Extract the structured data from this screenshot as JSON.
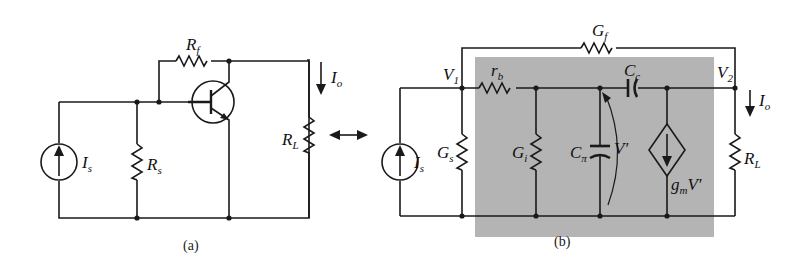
{
  "figure": {
    "panel_a": {
      "caption": "(a)",
      "labels": {
        "Rf": {
          "main": "R",
          "sub": "f"
        },
        "Io": {
          "main": "I",
          "sub": "o"
        },
        "RL": {
          "main": "R",
          "sub": "L"
        },
        "Is": {
          "main": "I",
          "sub": "s"
        },
        "Rs": {
          "main": "R",
          "sub": "s"
        }
      },
      "components": [
        "current-source Is",
        "resistor Rs",
        "resistor Rf",
        "pnp-transistor",
        "resistor RL"
      ]
    },
    "equivalence_arrow": "↔",
    "panel_b": {
      "caption": "(b)",
      "labels": {
        "Gf": {
          "main": "G",
          "sub": "f"
        },
        "V1": {
          "main": "V",
          "sub": "1"
        },
        "V2": {
          "main": "V",
          "sub": "2"
        },
        "rb": {
          "main": "r",
          "sub": "b"
        },
        "Cc": {
          "main": "C",
          "sub": "c"
        },
        "Io": {
          "main": "I",
          "sub": "o"
        },
        "Is": {
          "main": "I",
          "sub": "s"
        },
        "Gs": {
          "main": "G",
          "sub": "s"
        },
        "Gi": {
          "main": "G",
          "sub": "i"
        },
        "Cpi": {
          "main": "C",
          "sub": "π"
        },
        "Vp": {
          "main": "V′"
        },
        "gmV": {
          "main": "g",
          "sub": "m",
          "tail": "V′"
        },
        "RL": {
          "main": "R",
          "sub": "L"
        }
      },
      "shade_color": "#b4b4b4",
      "components": [
        "current-source Is",
        "conductance Gs",
        "conductance Gf",
        "resistor rb",
        "conductance Gi",
        "capacitor Cπ",
        "capacitor Cc",
        "dependent-current-source gmV′",
        "resistor RL"
      ]
    }
  }
}
